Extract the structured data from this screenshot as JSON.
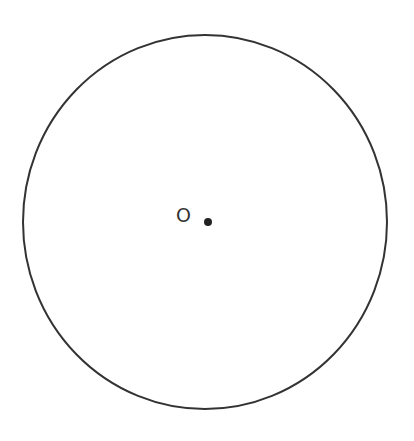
{
  "diagram": {
    "type": "circle-with-center",
    "circle": {
      "cx": 205,
      "cy": 222,
      "rx": 182,
      "ry": 187,
      "stroke": "#333333",
      "stroke_width": 2
    },
    "center_point": {
      "x": 208,
      "y": 222,
      "r": 4,
      "color": "#222222"
    },
    "center_label": {
      "text": "O",
      "x": 176,
      "y": 222
    }
  }
}
